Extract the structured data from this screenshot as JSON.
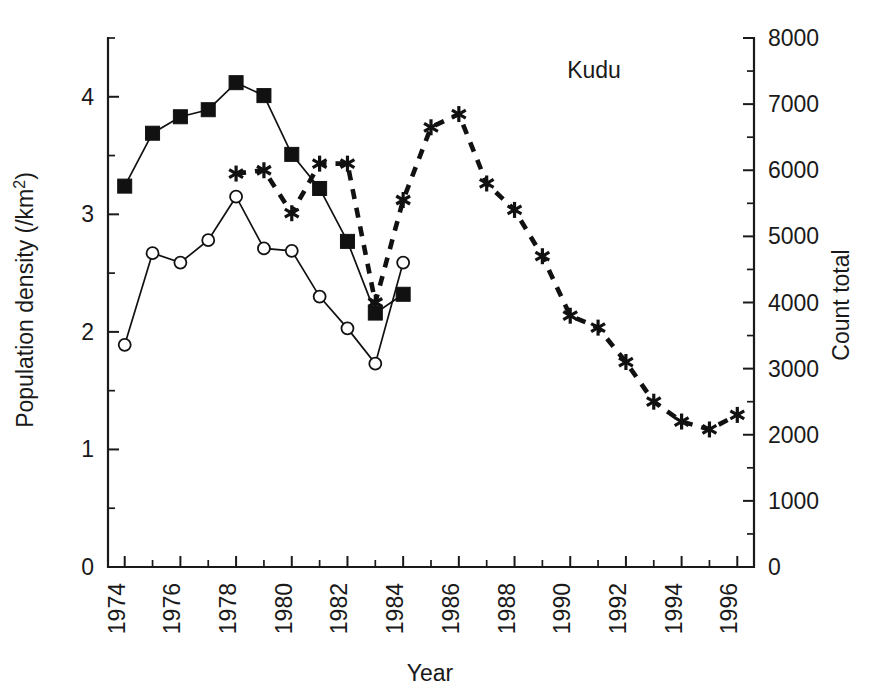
{
  "chart_data": {
    "type": "line",
    "title": "Kudu",
    "xlabel": "Year",
    "ylabel": "Population density (/km2)",
    "ylabel_display": "Population density (/km²)",
    "y2label": "Count total",
    "xlim": [
      1973.4,
      1996.6
    ],
    "ylim": [
      0,
      4.5
    ],
    "y2lim": [
      0,
      8000
    ],
    "grid": false,
    "legend": "none",
    "x_tick_labels": [
      "1974",
      "1976",
      "1978",
      "1980",
      "1982",
      "1984",
      "1986",
      "1988",
      "1990",
      "1992",
      "1994",
      "1996"
    ],
    "x_tick_values": [
      1974,
      1976,
      1978,
      1980,
      1982,
      1984,
      1986,
      1988,
      1990,
      1992,
      1994,
      1996
    ],
    "x_minor_tick_values": [
      1975,
      1977,
      1979,
      1981,
      1983,
      1985,
      1987,
      1989,
      1991,
      1993,
      1995
    ],
    "y_tick_labels": [
      "0",
      "1",
      "2",
      "3",
      "4"
    ],
    "y_tick_values": [
      0,
      1,
      2,
      3,
      4
    ],
    "y_minor_tick_values": [
      0.5,
      1.5,
      2.5,
      3.5
    ],
    "y2_tick_labels": [
      "0",
      "1000",
      "2000",
      "3000",
      "4000",
      "5000",
      "6000",
      "7000",
      "8000"
    ],
    "y2_tick_values": [
      0,
      1000,
      2000,
      3000,
      4000,
      5000,
      6000,
      7000,
      8000
    ],
    "y2_minor_tick_values": [
      500,
      1500,
      2500,
      3500,
      4500,
      5500,
      6500,
      7500
    ],
    "series": [
      {
        "name": "filled-square-series",
        "marker": "filled-square",
        "linestyle": "solid",
        "axis": "left",
        "x": [
          1974,
          1975,
          1976,
          1977,
          1978,
          1979,
          1980,
          1981,
          1982,
          1983,
          1984
        ],
        "values": [
          3.24,
          3.69,
          3.83,
          3.89,
          4.12,
          4.01,
          3.51,
          3.22,
          2.77,
          2.16,
          2.32
        ]
      },
      {
        "name": "open-circle-series",
        "marker": "open-circle",
        "linestyle": "solid",
        "axis": "left",
        "x": [
          1974,
          1975,
          1976,
          1977,
          1978,
          1979,
          1980,
          1981,
          1982,
          1983,
          1984
        ],
        "values": [
          1.89,
          2.67,
          2.59,
          2.78,
          3.15,
          2.71,
          2.69,
          2.3,
          2.03,
          1.73,
          2.59
        ]
      },
      {
        "name": "asterisk-count-series",
        "marker": "asterisk",
        "linestyle": "dashed",
        "axis": "right",
        "x": [
          1978,
          1979,
          1980,
          1981,
          1982,
          1983,
          1984,
          1985,
          1986,
          1987,
          1988,
          1989,
          1990,
          1991,
          1992,
          1993,
          1994,
          1995,
          1996
        ],
        "values": [
          5950,
          6000,
          5350,
          6100,
          6100,
          4000,
          5550,
          6650,
          6850,
          5800,
          5400,
          4700,
          3800,
          3620,
          3100,
          2500,
          2200,
          2080,
          2300
        ],
        "values_left_axis_equivalent": [
          3.36,
          3.38,
          3.0,
          3.46,
          3.46,
          2.26,
          3.13,
          3.75,
          3.87,
          3.28,
          3.05,
          2.65,
          2.15,
          2.04,
          1.75,
          1.41,
          1.24,
          1.17,
          1.29
        ]
      }
    ]
  }
}
